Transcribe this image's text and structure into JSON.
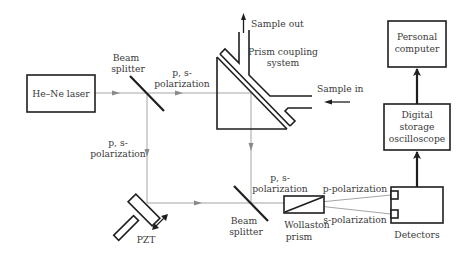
{
  "diagram": {
    "components": {
      "laser": "He–Ne laser",
      "beam_splitter_1": [
        "Beam",
        "splitter"
      ],
      "beam_splitter_2": [
        "Beam",
        "splitter"
      ],
      "prism_system": [
        "Prism coupling",
        "system"
      ],
      "pzt": "PZT",
      "wollaston": [
        "Wollaston",
        "prism"
      ],
      "detectors": "Detectors",
      "oscilloscope": [
        "Digital",
        "storage",
        "oscilloscope"
      ],
      "computer": [
        "Personal",
        "computer"
      ]
    },
    "labels": {
      "sample_out": "Sample out",
      "sample_in": "Sample in",
      "pol_top": [
        "p, s-",
        "polarization"
      ],
      "pol_left": [
        "p, s-",
        "polarization"
      ],
      "pol_mid": [
        "p, s-",
        "polarization"
      ],
      "p_pol": "p-polarization",
      "s_pol": "s-polarization"
    },
    "colors": {
      "ink": "#1e1e1e",
      "beam": "#9a9a9a",
      "text": "#3a3a3a"
    }
  }
}
